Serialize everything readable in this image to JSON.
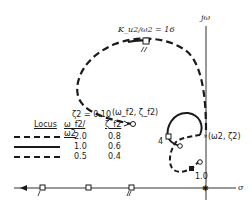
{
  "diagram": {
    "type": "root-locus",
    "axes": {
      "imag_label": "jω",
      "real_label": "σ"
    },
    "gain_label": "K_u2/ω2 = 16",
    "zeta_label": "ζ2 = 0.10",
    "pole_label_f2": "(ω_f2, ζ_f2)",
    "pole_label_2": "(ω2, ζ2)",
    "inner_labels": {
      "four": "4",
      "one": "1.0"
    },
    "legend": {
      "headers": [
        "Locus",
        "ω_f2/ω2",
        "ζ_f2"
      ],
      "rows": [
        {
          "style": "long-short dash",
          "ratio": "2.0",
          "zeta": "0.8"
        },
        {
          "style": "solid",
          "ratio": "1.0",
          "zeta": "0.6"
        },
        {
          "style": "dashed",
          "ratio": "0.5",
          "zeta": "0.4"
        }
      ]
    }
  }
}
